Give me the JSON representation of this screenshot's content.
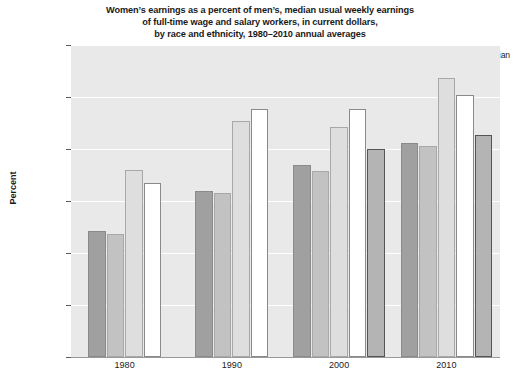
{
  "title": {
    "line1": "Women’s earnings as a percent of men’s, median usual weekly earnings",
    "line2": "of full-time wage and salary workers, in current dollars,",
    "line3": "by race and ethnicity, 1980–2010 annual averages"
  },
  "axis": {
    "ylabel": "Percent",
    "yticks": [
      "40",
      "50",
      "60",
      "70",
      "80",
      "90",
      "100"
    ],
    "xticks": [
      "1980",
      "1990",
      "2000",
      "2010"
    ]
  },
  "legend": {
    "items": [
      {
        "label": "Total",
        "color": "#a0a0a0",
        "border": "#8a8a8a"
      },
      {
        "label": "White",
        "color": "#c2c2c2",
        "border": "#a8a8a8"
      },
      {
        "label": "Black or\nAfrican\nAmerican",
        "color": "#dedede",
        "border": "#a8a8a8"
      },
      {
        "label": "Hispanic or\nLatino\nethnicity",
        "color": "#ffffff",
        "border": "#8a8a8a"
      },
      {
        "label": "Asian",
        "color": "#b4b4b4",
        "border": "#555555"
      }
    ]
  },
  "chart_data": {
    "type": "bar",
    "title": "Women’s earnings as a percent of men’s, median usual weekly earnings of full-time wage and salary workers, in current dollars, by race and ethnicity, 1980–2010 annual averages",
    "xlabel": "",
    "ylabel": "Percent",
    "ylim": [
      40,
      100
    ],
    "ytick_step": 10,
    "grid": true,
    "legend_position": "top",
    "categories": [
      "1980",
      "1990",
      "2000",
      "2010"
    ],
    "series": [
      {
        "name": "Total",
        "values": [
          64.2,
          71.9,
          76.9,
          81.2
        ]
      },
      {
        "name": "White",
        "values": [
          63.6,
          71.6,
          75.8,
          80.5
        ]
      },
      {
        "name": "Black or African American",
        "values": [
          75.9,
          85.4,
          84.2,
          93.7
        ]
      },
      {
        "name": "Hispanic or Latino ethnicity",
        "values": [
          73.4,
          87.6,
          87.7,
          90.4
        ]
      },
      {
        "name": "Asian",
        "values": [
          null,
          null,
          80.0,
          82.6
        ]
      }
    ]
  }
}
